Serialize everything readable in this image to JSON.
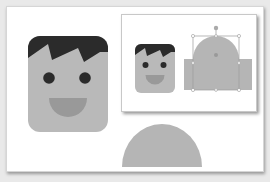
{
  "scene": {
    "description": "Illustration of a cartoon face icon built from shapes, with an inset showing shape editing selection",
    "colors": {
      "background": "#e9e9e9",
      "paper": "#ffffff",
      "hair": "#2b2b2b",
      "face": "#b9b9b9",
      "eye": "#2b2b2b",
      "mouth": "#999999",
      "shape_fill": "#b5b5b5",
      "selection": "#9a9a9a"
    },
    "main_face": {
      "label": "cartoon-face"
    },
    "semicircle": {
      "label": "half-circle-shape"
    },
    "inset": {
      "label": "inset-editing-view",
      "small_face": {
        "label": "cartoon-face-small"
      },
      "selected_shape": {
        "label": "dome-shape-selected",
        "handles": 8
      }
    }
  }
}
